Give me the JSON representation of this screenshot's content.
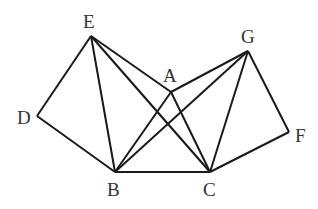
{
  "diagram": {
    "points": {
      "A": {
        "label": "A",
        "x": 171,
        "y": 92
      },
      "B": {
        "label": "B",
        "x": 115,
        "y": 172
      },
      "C": {
        "label": "C",
        "x": 210,
        "y": 172
      },
      "D": {
        "label": "D",
        "x": 37,
        "y": 116
      },
      "E": {
        "label": "E",
        "x": 91,
        "y": 36
      },
      "F": {
        "label": "F",
        "x": 289,
        "y": 132
      },
      "G": {
        "label": "G",
        "x": 248,
        "y": 51
      }
    },
    "segments": [
      [
        "E",
        "D"
      ],
      [
        "D",
        "B"
      ],
      [
        "B",
        "C"
      ],
      [
        "C",
        "F"
      ],
      [
        "F",
        "G"
      ],
      [
        "E",
        "A"
      ],
      [
        "E",
        "C"
      ],
      [
        "A",
        "G"
      ],
      [
        "G",
        "B"
      ],
      [
        "A",
        "B"
      ],
      [
        "A",
        "C"
      ],
      [
        "E",
        "B"
      ],
      [
        "G",
        "C"
      ]
    ],
    "stroke_color": "#1a1a1a"
  }
}
